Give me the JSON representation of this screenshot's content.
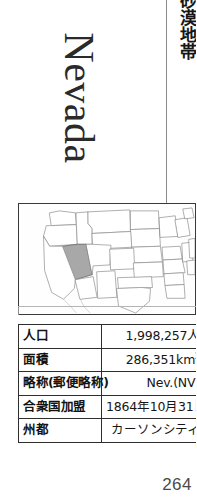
{
  "page": {
    "folio": "264",
    "background_color": "#ffffff",
    "rule_color": "#8b8b8b"
  },
  "vertical_text": {
    "japanese_caption": "砂漠地帯"
  },
  "title": {
    "state_name": "Nevada"
  },
  "map": {
    "caption_label": "map-united-states-nevada-highlighted",
    "highlight_color": "#a8a8a8",
    "outline_color": "#8c8c8c",
    "frame_color": "#3a3a3a",
    "highlighted_state": "Nevada"
  },
  "fact_table": {
    "rows": [
      {
        "key": "人口",
        "value": "1,998,257人"
      },
      {
        "key": "面積",
        "value": "286,351km",
        "unit_sup": "2"
      },
      {
        "key": "略称(郵便略称)",
        "value": "Nev.(NV)"
      },
      {
        "key": "合衆国加盟",
        "value": "1864年10月31日"
      },
      {
        "key": "州都",
        "value": "カーソンシティ"
      }
    ]
  }
}
